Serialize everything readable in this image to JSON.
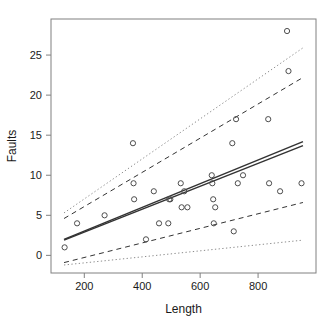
{
  "chart_data": {
    "type": "scatter",
    "title": "",
    "xlabel": "Length",
    "ylabel": "Faults",
    "xlim": [
      85,
      1000
    ],
    "ylim": [
      -2.2,
      29.5
    ],
    "xticks": [
      200,
      400,
      600,
      800
    ],
    "yticks": [
      0,
      5,
      10,
      15,
      20,
      25
    ],
    "grid": false,
    "legend": "none",
    "points": [
      {
        "x": 132,
        "y": 1
      },
      {
        "x": 175,
        "y": 4
      },
      {
        "x": 270,
        "y": 5
      },
      {
        "x": 368,
        "y": 14
      },
      {
        "x": 370,
        "y": 9
      },
      {
        "x": 372,
        "y": 7
      },
      {
        "x": 413,
        "y": 2
      },
      {
        "x": 440,
        "y": 8
      },
      {
        "x": 458,
        "y": 4
      },
      {
        "x": 490,
        "y": 4
      },
      {
        "x": 493,
        "y": 7
      },
      {
        "x": 497,
        "y": 7
      },
      {
        "x": 533,
        "y": 9
      },
      {
        "x": 536,
        "y": 6
      },
      {
        "x": 545,
        "y": 8
      },
      {
        "x": 556,
        "y": 6
      },
      {
        "x": 640,
        "y": 10
      },
      {
        "x": 642,
        "y": 9
      },
      {
        "x": 645,
        "y": 7
      },
      {
        "x": 647,
        "y": 4
      },
      {
        "x": 652,
        "y": 6
      },
      {
        "x": 711,
        "y": 14
      },
      {
        "x": 716,
        "y": 3
      },
      {
        "x": 724,
        "y": 17
      },
      {
        "x": 730,
        "y": 9
      },
      {
        "x": 748,
        "y": 10
      },
      {
        "x": 835,
        "y": 17
      },
      {
        "x": 838,
        "y": 9
      },
      {
        "x": 876,
        "y": 8
      },
      {
        "x": 900,
        "y": 28
      },
      {
        "x": 905,
        "y": 23
      },
      {
        "x": 950,
        "y": 9
      }
    ],
    "lines": [
      {
        "name": "fit-line-a",
        "style": "solid",
        "x1": 130,
        "y1": 2.0,
        "x2": 955,
        "y2": 14.2
      },
      {
        "name": "fit-line-b",
        "style": "solid",
        "x1": 130,
        "y1": 1.9,
        "x2": 955,
        "y2": 13.7
      },
      {
        "name": "ci-upper-dashed",
        "style": "dashed",
        "x1": 130,
        "y1": 4.6,
        "x2": 955,
        "y2": 22.2
      },
      {
        "name": "ci-lower-dashed",
        "style": "dashed",
        "x1": 130,
        "y1": -0.9,
        "x2": 955,
        "y2": 6.6
      },
      {
        "name": "pi-upper-dotted",
        "style": "dotted",
        "x1": 130,
        "y1": 5.3,
        "x2": 955,
        "y2": 25.9
      },
      {
        "name": "pi-lower-dotted",
        "style": "dotted",
        "x1": 130,
        "y1": -1.2,
        "x2": 955,
        "y2": 1.9
      }
    ],
    "colors": {
      "point": "#4d4d4d",
      "fit": "#333333",
      "dashed_band": "#333333",
      "dotted_band": "#8c8c8c",
      "frame": "#808080",
      "text": "#1a1a1a"
    }
  },
  "axes": {
    "x_tick_labels": [
      "200",
      "400",
      "600",
      "800"
    ],
    "y_tick_labels": [
      "0",
      "5",
      "10",
      "15",
      "20",
      "25"
    ],
    "x_title": "Length",
    "y_title": "Faults"
  }
}
